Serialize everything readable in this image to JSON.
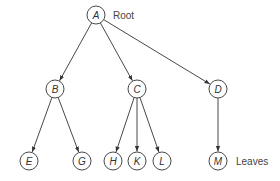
{
  "diagram": {
    "type": "tree",
    "colors": {
      "stroke": "#333333",
      "text": "#333333",
      "background": "#ffffff"
    },
    "annotations": [
      {
        "id": "root-label",
        "text": "Root",
        "x": 113,
        "y": 19
      },
      {
        "id": "leaves-label",
        "text": "Leaves",
        "x": 236,
        "y": 165
      }
    ],
    "nodes": [
      {
        "id": "A",
        "label": "A",
        "x": 96,
        "y": 15
      },
      {
        "id": "B",
        "label": "B",
        "x": 55,
        "y": 89
      },
      {
        "id": "C",
        "label": "C",
        "x": 137,
        "y": 89
      },
      {
        "id": "D",
        "label": "D",
        "x": 218,
        "y": 89
      },
      {
        "id": "E",
        "label": "E",
        "x": 29,
        "y": 161
      },
      {
        "id": "G",
        "label": "G",
        "x": 82,
        "y": 161
      },
      {
        "id": "H",
        "label": "H",
        "x": 113,
        "y": 161
      },
      {
        "id": "K",
        "label": "K",
        "x": 137,
        "y": 161
      },
      {
        "id": "L",
        "label": "L",
        "x": 162,
        "y": 161
      },
      {
        "id": "M",
        "label": "M",
        "x": 218,
        "y": 161
      }
    ],
    "edges": [
      {
        "from": "A",
        "to": "B"
      },
      {
        "from": "A",
        "to": "C"
      },
      {
        "from": "A",
        "to": "D"
      },
      {
        "from": "B",
        "to": "E"
      },
      {
        "from": "B",
        "to": "G"
      },
      {
        "from": "C",
        "to": "H"
      },
      {
        "from": "C",
        "to": "K"
      },
      {
        "from": "C",
        "to": "L"
      },
      {
        "from": "D",
        "to": "M"
      }
    ],
    "node_radius": 9
  }
}
